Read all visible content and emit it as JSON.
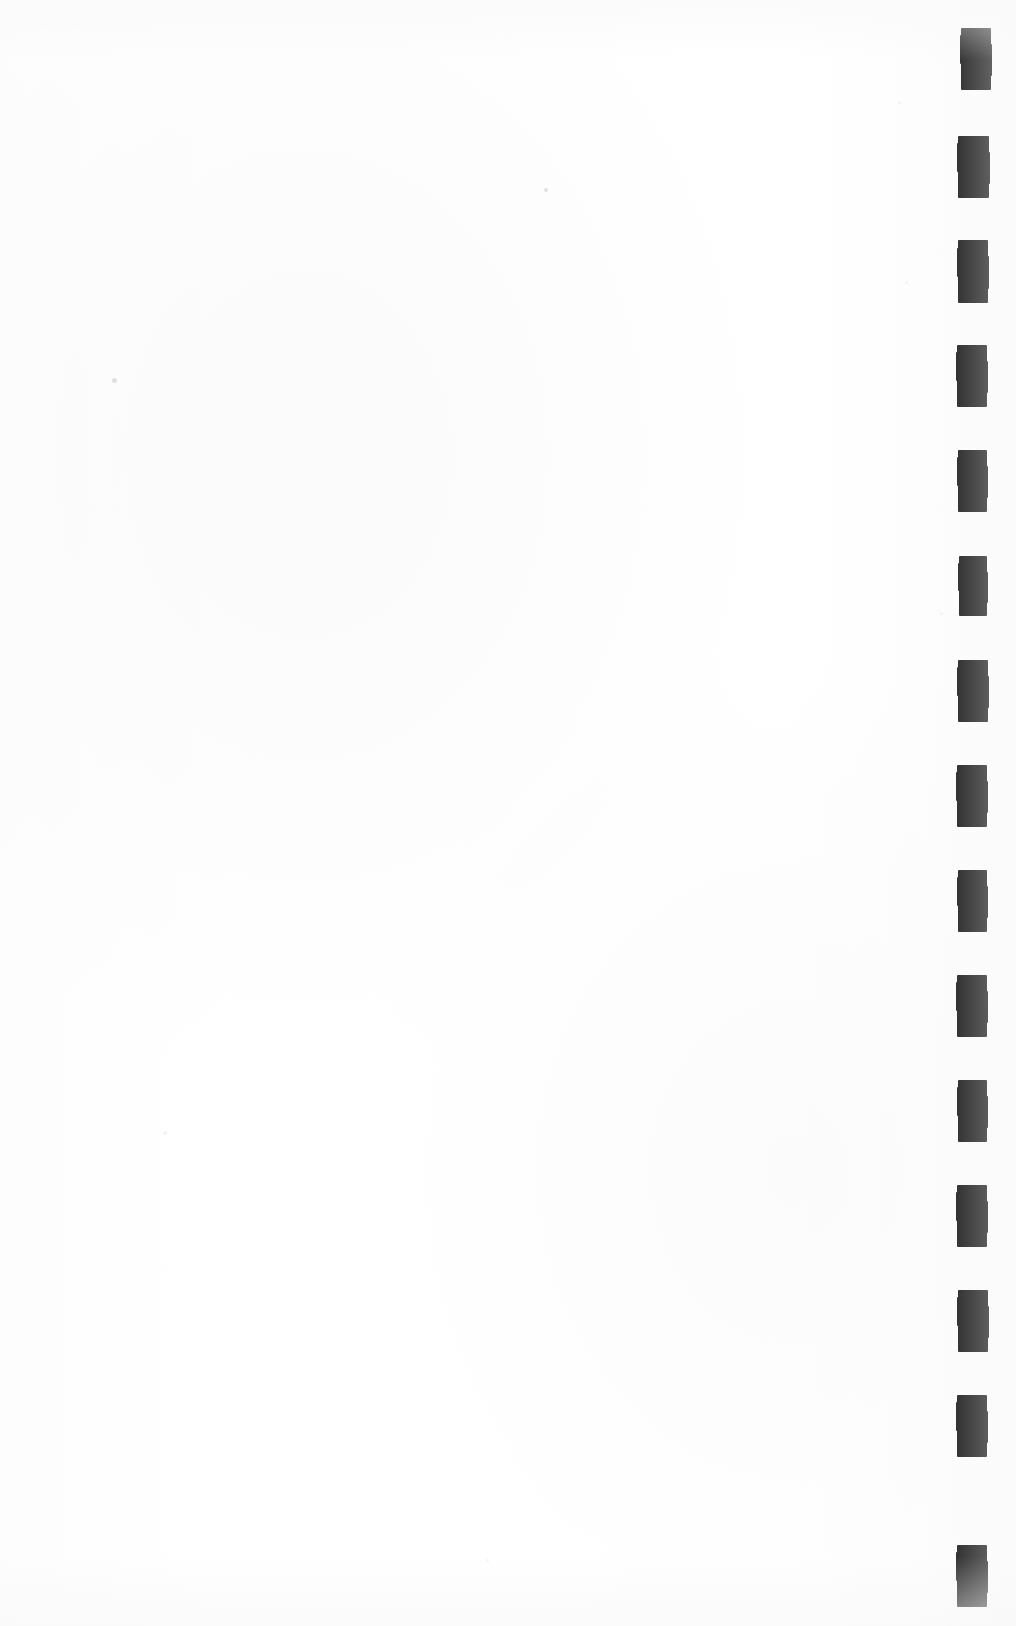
{
  "document": {
    "kind": "scanned-page",
    "title": "Blank scanned page",
    "page_width": 1016,
    "page_height": 1626,
    "background_color": "#ffffff",
    "body_text": "",
    "body_note": "Page contains no printed text, headings, figures or captions."
  },
  "register_strip": {
    "name": "register-mark-strip",
    "description": "Vertical column of solid black rectangular register marks along the right edge of the scan",
    "mark_color": "#0a0a0a",
    "mark_count": 15,
    "mark_width": 30,
    "mark_height": 62,
    "pitch": 105,
    "left_edge_x": 957,
    "first_mark_top": 28,
    "marks": [
      {
        "index": 1,
        "x": 961,
        "y": 28,
        "w": 30,
        "h": 62
      },
      {
        "index": 2,
        "x": 958,
        "y": 136,
        "w": 31,
        "h": 62
      },
      {
        "index": 3,
        "x": 958,
        "y": 240,
        "w": 30,
        "h": 63
      },
      {
        "index": 4,
        "x": 957,
        "y": 345,
        "w": 30,
        "h": 62
      },
      {
        "index": 5,
        "x": 958,
        "y": 450,
        "w": 29,
        "h": 62
      },
      {
        "index": 6,
        "x": 959,
        "y": 556,
        "w": 28,
        "h": 60
      },
      {
        "index": 7,
        "x": 958,
        "y": 660,
        "w": 30,
        "h": 62
      },
      {
        "index": 8,
        "x": 957,
        "y": 765,
        "w": 30,
        "h": 62
      },
      {
        "index": 9,
        "x": 958,
        "y": 870,
        "w": 29,
        "h": 62
      },
      {
        "index": 10,
        "x": 957,
        "y": 975,
        "w": 30,
        "h": 62
      },
      {
        "index": 11,
        "x": 958,
        "y": 1080,
        "w": 29,
        "h": 62
      },
      {
        "index": 12,
        "x": 957,
        "y": 1185,
        "w": 30,
        "h": 62
      },
      {
        "index": 13,
        "x": 958,
        "y": 1290,
        "w": 30,
        "h": 62
      },
      {
        "index": 14,
        "x": 957,
        "y": 1395,
        "w": 30,
        "h": 62
      },
      {
        "index": 15,
        "x": 957,
        "y": 1545,
        "w": 30,
        "h": 62
      }
    ]
  },
  "scan_artifacts": {
    "name": "scan-specks",
    "description": "Faint dust / noise specks left by the scanner on the blank sheet",
    "specks": [
      {
        "x": 112,
        "y": 378,
        "size": 5,
        "faint": false
      },
      {
        "x": 544,
        "y": 188,
        "size": 4,
        "faint": false
      },
      {
        "x": 163,
        "y": 1131,
        "size": 4,
        "faint": true
      },
      {
        "x": 486,
        "y": 1559,
        "size": 3,
        "faint": true
      },
      {
        "x": 905,
        "y": 281,
        "size": 3,
        "faint": true
      },
      {
        "x": 898,
        "y": 101,
        "size": 3,
        "faint": true
      },
      {
        "x": 940,
        "y": 612,
        "size": 3,
        "faint": true
      }
    ]
  }
}
